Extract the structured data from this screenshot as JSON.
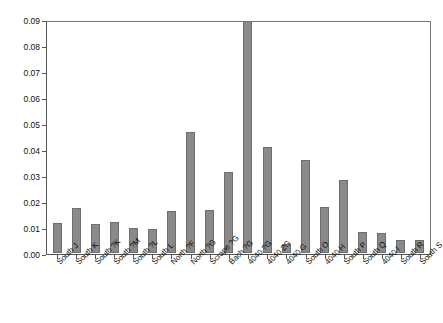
{
  "chart_data": {
    "type": "bar",
    "title": "",
    "subtitle": "",
    "xlabel": "",
    "ylabel": "",
    "ylim": [
      0,
      0.09
    ],
    "ytick_values": [
      0,
      0.01,
      0.02,
      0.03,
      0.04,
      0.05,
      0.06,
      0.07,
      0.08,
      0.09
    ],
    "ytick_labels": [
      "0.00",
      "0.01",
      "0.02",
      "0.03",
      "0.04",
      "0.05",
      "0.06",
      "0.07",
      "0.08",
      "0.09"
    ],
    "grid": false,
    "legend": null,
    "bar_color": "#8a8a8a",
    "bar_edge_color": "#6e6e6e",
    "axis_color": "#555555",
    "categories": [
      "South J",
      "South K",
      "South ?K",
      "South ?M",
      "South ?L",
      "South L",
      "North ?F",
      "North ?G",
      "Scrape ?G",
      "Bach ?G",
      "4040 ?G",
      "4040 2G",
      "4040 G",
      "South O",
      "4040 H",
      "South P",
      "South Q",
      "4040 I",
      "South R",
      "South S"
    ],
    "values": [
      0.0118,
      0.0175,
      0.0111,
      0.0119,
      0.0096,
      0.0094,
      0.0163,
      0.0469,
      0.0167,
      0.0316,
      0.09,
      0.041,
      0.0035,
      0.036,
      0.018,
      0.0285,
      0.0083,
      0.0079,
      0.005,
      0.005
    ],
    "labels_rotation_deg": -45,
    "note_clipped_bar": "4040 ?G reaches the top of the axis at 0.09"
  }
}
